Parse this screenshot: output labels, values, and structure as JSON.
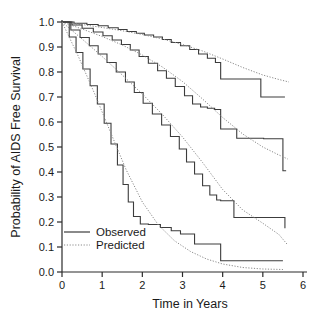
{
  "chart_data": {
    "type": "line",
    "title": "",
    "subtitle": "",
    "xlabel": "Time in Years",
    "ylabel": "Probability of AIDS Free Survival",
    "xlim": [
      0,
      6
    ],
    "ylim": [
      0.0,
      1.0
    ],
    "grid": false,
    "legend_position": "lower-left-inside",
    "xticks": [
      "0",
      "1",
      "2",
      "3",
      "4",
      "5",
      "6"
    ],
    "xtick_values": [
      0,
      1,
      2,
      3,
      4,
      5,
      6
    ],
    "yticks": [
      "0.0",
      "0.1",
      "0.2",
      "0.3",
      "0.4",
      "0.5",
      "0.6",
      "0.7",
      "0.8",
      "0.9",
      "1.0"
    ],
    "ytick_values": [
      0.0,
      0.1,
      0.2,
      0.3,
      0.4,
      0.5,
      0.6,
      0.7,
      0.8,
      0.9,
      1.0
    ],
    "legend": [
      {
        "label": "Observed",
        "style": "solid",
        "color": "#3c3c3c"
      },
      {
        "label": "Predicted",
        "style": "dotted",
        "color": "#8a8a8a"
      }
    ],
    "annotations": [],
    "series": [
      {
        "name": "Group 1 Observed",
        "style": "solid",
        "color": "#3c3c3c",
        "step": true,
        "x": [
          0.0,
          0.3,
          0.62,
          0.9,
          1.15,
          1.4,
          1.62,
          1.85,
          2.05,
          2.28,
          2.5,
          2.72,
          2.95,
          3.18,
          3.4,
          3.62,
          3.82,
          3.95,
          4.3,
          4.95,
          5.55
        ],
        "values": [
          1.0,
          0.995,
          0.99,
          0.985,
          0.977,
          0.97,
          0.962,
          0.955,
          0.948,
          0.94,
          0.93,
          0.918,
          0.905,
          0.89,
          0.872,
          0.855,
          0.838,
          0.772,
          0.772,
          0.7,
          0.7
        ]
      },
      {
        "name": "Group 1 Predicted",
        "style": "dotted",
        "color": "#8a8a8a",
        "step": false,
        "x": [
          0.0,
          0.5,
          1.0,
          1.5,
          2.0,
          2.5,
          3.0,
          3.5,
          4.0,
          4.5,
          5.0,
          5.4,
          5.65
        ],
        "values": [
          1.0,
          0.99,
          0.978,
          0.965,
          0.95,
          0.932,
          0.91,
          0.884,
          0.852,
          0.818,
          0.788,
          0.77,
          0.76
        ]
      },
      {
        "name": "Group 2 Observed",
        "style": "solid",
        "color": "#3c3c3c",
        "step": true,
        "x": [
          0.0,
          0.25,
          0.5,
          0.78,
          1.02,
          1.25,
          1.48,
          1.7,
          1.92,
          2.15,
          2.38,
          2.6,
          2.82,
          3.05,
          3.25,
          3.45,
          3.62,
          3.8,
          3.95,
          4.35,
          5.02,
          5.5,
          5.58
        ],
        "values": [
          1.0,
          0.988,
          0.975,
          0.96,
          0.945,
          0.928,
          0.91,
          0.888,
          0.862,
          0.835,
          0.805,
          0.775,
          0.742,
          0.705,
          0.672,
          0.66,
          0.655,
          0.65,
          0.572,
          0.535,
          0.533,
          0.405,
          0.405
        ]
      },
      {
        "name": "Group 2 Predicted",
        "style": "dotted",
        "color": "#8a8a8a",
        "step": false,
        "x": [
          0.0,
          0.5,
          1.0,
          1.5,
          2.0,
          2.5,
          3.0,
          3.5,
          4.0,
          4.5,
          5.0,
          5.4,
          5.62
        ],
        "values": [
          1.0,
          0.972,
          0.942,
          0.908,
          0.868,
          0.82,
          0.762,
          0.692,
          0.618,
          0.552,
          0.5,
          0.468,
          0.452
        ]
      },
      {
        "name": "Group 3 Observed",
        "style": "solid",
        "color": "#3c3c3c",
        "step": true,
        "x": [
          0.0,
          0.22,
          0.45,
          0.68,
          0.9,
          1.12,
          1.35,
          1.58,
          1.8,
          2.02,
          2.25,
          2.48,
          2.7,
          2.92,
          3.1,
          3.3,
          3.5,
          3.68,
          3.85,
          3.95,
          4.28,
          5.55
        ],
        "values": [
          1.0,
          0.968,
          0.938,
          0.905,
          0.872,
          0.838,
          0.8,
          0.76,
          0.718,
          0.675,
          0.632,
          0.588,
          0.542,
          0.492,
          0.44,
          0.392,
          0.345,
          0.308,
          0.288,
          0.285,
          0.218,
          0.175
        ]
      },
      {
        "name": "Group 3 Predicted",
        "style": "dotted",
        "color": "#8a8a8a",
        "step": false,
        "x": [
          0.0,
          0.5,
          1.0,
          1.5,
          2.0,
          2.5,
          3.0,
          3.5,
          4.0,
          4.5,
          5.0,
          5.4,
          5.6
        ],
        "values": [
          1.0,
          0.932,
          0.862,
          0.788,
          0.712,
          0.63,
          0.54,
          0.438,
          0.33,
          0.248,
          0.195,
          0.15,
          0.112
        ]
      },
      {
        "name": "Group 4 Observed",
        "style": "solid",
        "color": "#3c3c3c",
        "step": true,
        "x": [
          0.0,
          0.18,
          0.35,
          0.52,
          0.7,
          0.88,
          1.05,
          1.22,
          1.38,
          1.52,
          1.65,
          1.78,
          1.95,
          2.15,
          2.45,
          2.72,
          2.95,
          3.3,
          3.95,
          5.5
        ],
        "values": [
          1.0,
          0.94,
          0.878,
          0.812,
          0.745,
          0.672,
          0.595,
          0.512,
          0.428,
          0.35,
          0.28,
          0.222,
          0.192,
          0.19,
          0.178,
          0.165,
          0.152,
          0.112,
          0.045,
          0.045
        ]
      },
      {
        "name": "Group 4 Predicted",
        "style": "dotted",
        "color": "#8a8a8a",
        "step": false,
        "x": [
          0.0,
          0.4,
          0.8,
          1.2,
          1.6,
          2.0,
          2.4,
          2.8,
          3.2,
          3.6,
          4.0,
          4.5,
          5.0,
          5.5
        ],
        "values": [
          1.0,
          0.865,
          0.718,
          0.562,
          0.408,
          0.28,
          0.188,
          0.125,
          0.082,
          0.052,
          0.032,
          0.018,
          0.012,
          0.01
        ]
      }
    ]
  }
}
